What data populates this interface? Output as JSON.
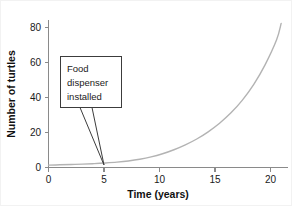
{
  "chart_data": {
    "type": "line",
    "title": "",
    "xlabel": "Time (years)",
    "ylabel": "Number of turtles",
    "xlim": [
      0,
      21
    ],
    "ylim": [
      0,
      88
    ],
    "xticks": [
      0,
      5,
      10,
      15,
      20
    ],
    "xtick_labels": [
      "0",
      "5",
      "10",
      "15",
      "20"
    ],
    "yticks": [
      0,
      20,
      40,
      60,
      80
    ],
    "ytick_labels": [
      "0",
      "20",
      "40",
      "60",
      "80"
    ],
    "grid": false,
    "legend": null,
    "series": [
      {
        "name": "turtle population",
        "color": "#b3b3b3",
        "x": [
          0,
          1,
          2,
          3,
          4,
          5,
          6,
          7,
          8,
          9,
          10,
          11,
          12,
          13,
          14,
          15,
          16,
          17,
          18,
          19,
          20,
          20.4
        ],
        "values": [
          1.4,
          1.6,
          1.8,
          2.0,
          2.3,
          2.7,
          3.2,
          3.9,
          4.9,
          6.3,
          8.2,
          10.6,
          13.5,
          17.0,
          21.3,
          26.4,
          32.6,
          40.2,
          49.6,
          61.4,
          76.2,
          86.0
        ]
      }
    ],
    "annotations": [
      {
        "text_lines": [
          "Food",
          "dispenser",
          "installed"
        ],
        "point_x": 5,
        "point_y": 2.7
      }
    ]
  },
  "annotation": {
    "line1": "Food",
    "line2": "dispenser",
    "line3": "installed"
  },
  "axes": {
    "x_title": "Time (years)",
    "y_title": "Number of turtles",
    "x_labels": [
      "0",
      "5",
      "10",
      "15",
      "20"
    ],
    "y_labels": [
      "0",
      "20",
      "40",
      "60",
      "80"
    ]
  },
  "colors": {
    "curve": "#b3b3b3",
    "axis": "#8a8a8a",
    "text": "#1a1a1a",
    "callout_border": "#3c3c3c",
    "background": "#ffffff"
  }
}
